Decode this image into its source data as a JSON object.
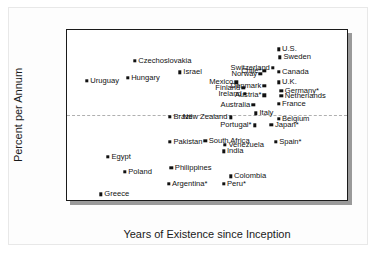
{
  "chart_data": {
    "type": "scatter",
    "title": "",
    "xlabel": "Years of Existence since Inception",
    "ylabel": "Percent per Annum",
    "xlim": [
      0,
      100
    ],
    "ylim": [
      -6,
      6
    ],
    "xticks": [
      0,
      20,
      40,
      60,
      80,
      100
    ],
    "xticks_minor": [
      10,
      30,
      50,
      70,
      90
    ],
    "yticks": [
      6,
      5,
      4,
      3,
      2,
      1,
      0,
      -1,
      -2,
      -3,
      -4,
      -5,
      -6
    ],
    "ytick_labels": [
      "6",
      "5",
      "4",
      "3",
      "2",
      "1",
      "0",
      "–1",
      "–2",
      "–3",
      "–4",
      "–5",
      "–6"
    ],
    "grid": false,
    "legend": "none",
    "zero_line": true,
    "marker_color": "#111111",
    "frame_color": "#1a1a1a",
    "zero_line_color": "#b0b0b0",
    "points": [
      {
        "label": "Uruguay",
        "x": 7,
        "y": 2.45,
        "side": "right"
      },
      {
        "label": "Czechoslovakia",
        "x": 24,
        "y": 3.85,
        "side": "right"
      },
      {
        "label": "Hungary",
        "x": 21.5,
        "y": 2.65,
        "side": "right"
      },
      {
        "label": "Israel",
        "x": 40,
        "y": 3.05,
        "side": "right"
      },
      {
        "label": "Chile*",
        "x": 70,
        "y": 3.15,
        "side": "left"
      },
      {
        "label": "Switzerland",
        "x": 73,
        "y": 3.35,
        "side": "left"
      },
      {
        "label": "U.S.",
        "x": 75,
        "y": 4.65,
        "side": "right"
      },
      {
        "label": "Sweden",
        "x": 75.5,
        "y": 4.1,
        "side": "right"
      },
      {
        "label": "Canada",
        "x": 75,
        "y": 3.1,
        "side": "right"
      },
      {
        "label": "Norway",
        "x": 68.5,
        "y": 2.95,
        "side": "left"
      },
      {
        "label": "Mexico",
        "x": 60,
        "y": 2.35,
        "side": "left"
      },
      {
        "label": "U.K.",
        "x": 75,
        "y": 2.35,
        "side": "right"
      },
      {
        "label": "Denmark",
        "x": 70,
        "y": 2.1,
        "side": "left"
      },
      {
        "label": "Finland",
        "x": 62.5,
        "y": 1.95,
        "side": "left"
      },
      {
        "label": "Germany*",
        "x": 76,
        "y": 1.75,
        "side": "right"
      },
      {
        "label": "Ireland",
        "x": 63,
        "y": 1.55,
        "side": "left"
      },
      {
        "label": "Netherlands",
        "x": 76,
        "y": 1.4,
        "side": "right"
      },
      {
        "label": "Austria*",
        "x": 70,
        "y": 1.45,
        "side": "left"
      },
      {
        "label": "France",
        "x": 75,
        "y": 0.85,
        "side": "right"
      },
      {
        "label": "Australia",
        "x": 66,
        "y": 0.8,
        "side": "left"
      },
      {
        "label": "Italy",
        "x": 67,
        "y": 0.2,
        "side": "right"
      },
      {
        "label": "Brazil",
        "x": 36.5,
        "y": -0.05,
        "side": "right"
      },
      {
        "label": "New Zealand",
        "x": 58,
        "y": -0.1,
        "side": "left"
      },
      {
        "label": "Belgium",
        "x": 75,
        "y": -0.2,
        "side": "right"
      },
      {
        "label": "Portugal*",
        "x": 66.5,
        "y": -0.65,
        "side": "left"
      },
      {
        "label": "Japan*",
        "x": 72.5,
        "y": -0.6,
        "side": "right"
      },
      {
        "label": "South Africa",
        "x": 49,
        "y": -1.75,
        "side": "right"
      },
      {
        "label": "Pakistan",
        "x": 36.5,
        "y": -1.8,
        "side": "right"
      },
      {
        "label": "Venezuela",
        "x": 56,
        "y": -2.0,
        "side": "right"
      },
      {
        "label": "Spain*",
        "x": 74,
        "y": -1.8,
        "side": "right"
      },
      {
        "label": "India",
        "x": 55.5,
        "y": -2.45,
        "side": "right"
      },
      {
        "label": "Egypt",
        "x": 14.5,
        "y": -2.85,
        "side": "right"
      },
      {
        "label": "Philippines",
        "x": 37,
        "y": -3.6,
        "side": "right"
      },
      {
        "label": "Poland",
        "x": 20.5,
        "y": -3.9,
        "side": "right"
      },
      {
        "label": "Colombia",
        "x": 58,
        "y": -4.2,
        "side": "right"
      },
      {
        "label": "Argentina*",
        "x": 36,
        "y": -4.75,
        "side": "right"
      },
      {
        "label": "Peru*",
        "x": 55.5,
        "y": -4.75,
        "side": "right"
      },
      {
        "label": "Greece",
        "x": 12,
        "y": -5.45,
        "side": "right"
      }
    ]
  }
}
